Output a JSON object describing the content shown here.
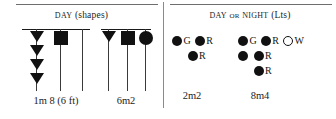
{
  "figure": {
    "background": "#ffffff",
    "ink": "#111111",
    "rule_color": "#6e6e6e"
  },
  "panels": {
    "day": {
      "title_small_caps": "Day",
      "title_rest": "(shapes)",
      "groups": [
        {
          "label": "1m 8 (6 ft)",
          "masts": [
            {
              "shapes": [
                "triangle-down",
                "triangle-down",
                "triangle-down",
                "triangle-down"
              ]
            },
            {
              "shapes": [
                "square"
              ]
            },
            {
              "shapes": []
            }
          ]
        },
        {
          "label": "6m2",
          "masts": [
            {
              "shapes": [
                "triangle-down"
              ]
            },
            {
              "shapes": [
                "square"
              ]
            },
            {
              "shapes": [
                "circle"
              ]
            }
          ]
        }
      ]
    },
    "night": {
      "title_small_caps_a": "Day",
      "title_conn": "or",
      "title_small_caps_b": "Night",
      "title_rest": "(Lts)",
      "groups": [
        {
          "label": "2m2",
          "rows": [
            [
              {
                "dot": "filled",
                "letter": "G"
              },
              {
                "dot": "filled",
                "letter": "R"
              }
            ],
            [
              {
                "dot": "none",
                "letter": ""
              },
              {
                "dot": "filled",
                "letter": "R"
              }
            ]
          ]
        },
        {
          "label": "8m4",
          "rows": [
            [
              {
                "dot": "filled",
                "letter": "G"
              },
              {
                "dot": "filled",
                "letter": "R"
              },
              {
                "dot": "hollow",
                "letter": "W"
              }
            ],
            [
              {
                "dot": "filled",
                "letter": ""
              },
              {
                "dot": "filled",
                "letter": "R"
              }
            ],
            [
              {
                "dot": "none",
                "letter": ""
              },
              {
                "dot": "filled",
                "letter": "R"
              }
            ]
          ]
        }
      ]
    }
  }
}
